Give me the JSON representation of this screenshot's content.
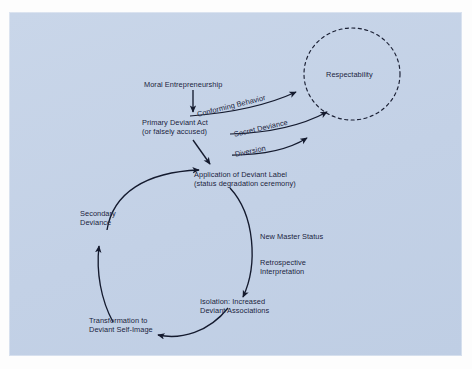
{
  "figure": {
    "background_color": "#c6d4e7",
    "text_color": "#16213c",
    "stroke_color": "#1a1f33",
    "type": "flow-cycle-diagram",
    "title": ""
  },
  "nodes": {
    "moral_entrepreneurship": "Moral Entrepreneurship",
    "primary_deviant_act_l1": "Primary Deviant Act",
    "primary_deviant_act_l2": "(or falsely accused)",
    "application_label_l1": "Application of Deviant Label",
    "application_label_l2": "(status degradation ceremony)",
    "respectability": "Respectability",
    "secondary_deviance_l1": "Secondary",
    "secondary_deviance_l2": "Deviance",
    "transformation_l1": "Transformation to",
    "transformation_l2": "Deviant Self-Image",
    "isolation_l1": "Isolation: Increased",
    "isolation_l2": "Deviant Associations"
  },
  "edge_labels": {
    "conforming_behavior": "Conforming Behavior",
    "secret_deviance": "Secret Deviance",
    "diversion": "Diversion",
    "new_master_status": "New Master Status",
    "retrospective_interpretation_l1": "Retrospective",
    "retrospective_interpretation_l2": "Interpretation"
  }
}
